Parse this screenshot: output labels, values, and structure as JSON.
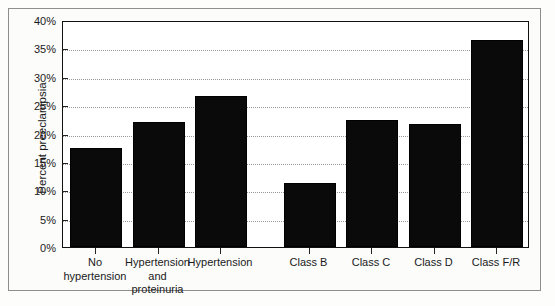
{
  "figure": {
    "alt_name": "bar-chart-percent-preeclampsia"
  },
  "chart_data": {
    "type": "bar",
    "title": "",
    "xlabel": "",
    "ylabel": "Percent preeclampsia",
    "ylim": [
      0,
      40
    ],
    "ytick_values": [
      0,
      5,
      10,
      15,
      20,
      25,
      30,
      35,
      40
    ],
    "ytick_labels": [
      "0%",
      "5%",
      "10%",
      "15%",
      "20%",
      "25%",
      "30%",
      "35%",
      "40%"
    ],
    "grid": true,
    "grid_axis": "y",
    "legend": null,
    "bar_color": "#0a0a0a",
    "categories": [
      "No hypertension",
      "Hypertension and proteinuria",
      "Hypertension",
      "Class B",
      "Class C",
      "Class D",
      "Class F/R"
    ],
    "category_lines": [
      [
        "No",
        "hypertension"
      ],
      [
        "Hypertension",
        "and",
        "proteinuria"
      ],
      [
        "Hypertension"
      ],
      [
        "Class B"
      ],
      [
        "Class C"
      ],
      [
        "Class D"
      ],
      [
        "Class F/R"
      ]
    ],
    "values": [
      17.5,
      22.1,
      26.6,
      11.2,
      22.4,
      21.7,
      36.5
    ],
    "value_labels": [
      "17.5%",
      "22.1%",
      "26.6%",
      "11.2%",
      "22.4%",
      "21.7%",
      "36.5%"
    ],
    "group_gap_after_index": 2
  }
}
